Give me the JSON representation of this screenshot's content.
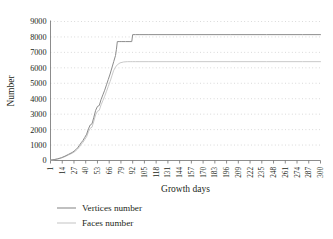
{
  "chart_data": {
    "type": "line",
    "title": "",
    "xlabel": "Growth days",
    "ylabel": "Number",
    "xlim": [
      1,
      300
    ],
    "ylim": [
      0,
      9000
    ],
    "grid": true,
    "grid_style": "dotted",
    "legend_position": "below",
    "ytick_labels": [
      "0",
      "1000",
      "2000",
      "3000",
      "4000",
      "5000",
      "6000",
      "7000",
      "8000",
      "9000"
    ],
    "ytick_values": [
      0,
      1000,
      2000,
      3000,
      4000,
      5000,
      6000,
      7000,
      8000,
      9000
    ],
    "xtick_labels": [
      "1",
      "14",
      "27",
      "40",
      "53",
      "66",
      "79",
      "92",
      "105",
      "118",
      "131",
      "144",
      "157",
      "170",
      "183",
      "196",
      "209",
      "222",
      "235",
      "248",
      "261",
      "274",
      "287",
      "300"
    ],
    "xtick_values": [
      1,
      14,
      27,
      40,
      53,
      66,
      79,
      92,
      105,
      118,
      131,
      144,
      157,
      170,
      183,
      196,
      209,
      222,
      235,
      248,
      261,
      274,
      287,
      300
    ],
    "colors": {
      "vertices": "#8c8c8c",
      "faces": "#c9c9c9",
      "axis": "#6f6f6f",
      "grid": "#bdbdbd",
      "text": "#231f20"
    },
    "series": [
      {
        "name": "Vertices number",
        "color": "#8c8c8c",
        "x": [
          1,
          5,
          9,
          13,
          17,
          21,
          25,
          27,
          29,
          31,
          33,
          35,
          37,
          39,
          41,
          43,
          45,
          47,
          49,
          51,
          53,
          55,
          57,
          59,
          61,
          63,
          65,
          67,
          69,
          71,
          73,
          74,
          75,
          77,
          80,
          84,
          88,
          91,
          92,
          95,
          100,
          110,
          130,
          160,
          200,
          240,
          280,
          300
        ],
        "y": [
          30,
          60,
          110,
          180,
          280,
          400,
          520,
          600,
          700,
          820,
          980,
          1150,
          1300,
          1500,
          1700,
          2050,
          2300,
          2380,
          2800,
          3250,
          3500,
          3560,
          3950,
          4250,
          4550,
          4900,
          5250,
          5600,
          6000,
          6400,
          6800,
          7200,
          7700,
          7700,
          7700,
          7700,
          7700,
          7700,
          8150,
          8150,
          8150,
          8150,
          8150,
          8150,
          8150,
          8150,
          8150,
          8150
        ]
      },
      {
        "name": "Faces number",
        "color": "#c9c9c9",
        "x": [
          1,
          5,
          9,
          13,
          17,
          21,
          25,
          27,
          29,
          31,
          33,
          35,
          37,
          39,
          41,
          43,
          45,
          47,
          49,
          51,
          53,
          55,
          57,
          59,
          61,
          63,
          65,
          67,
          69,
          71,
          73,
          75,
          78,
          82,
          86,
          90,
          92,
          95,
          100,
          110,
          130,
          160,
          200,
          240,
          280,
          300
        ],
        "y": [
          20,
          50,
          95,
          160,
          250,
          360,
          470,
          540,
          630,
          740,
          880,
          1040,
          1180,
          1360,
          1540,
          1860,
          2090,
          2160,
          2550,
          2960,
          3190,
          3250,
          3600,
          3880,
          4160,
          4480,
          4800,
          5120,
          5480,
          5840,
          6050,
          6200,
          6320,
          6380,
          6400,
          6400,
          6400,
          6400,
          6400,
          6400,
          6400,
          6400,
          6400,
          6400,
          6400,
          6400
        ]
      }
    ]
  },
  "legend": {
    "items": [
      {
        "label": "Vertices number",
        "color": "#8c8c8c"
      },
      {
        "label": "Faces number",
        "color": "#c9c9c9"
      }
    ]
  }
}
